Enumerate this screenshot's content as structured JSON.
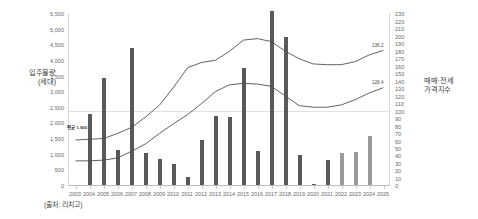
{
  "caption": "(출처: 리치고)",
  "axes": {
    "left_title": "입주물량\n(세대)",
    "right_title": "매매·전세\n가격지수",
    "left_ticks": [
      "5,500",
      "5,000",
      "4,500",
      "4,000",
      "3,500",
      "3,000",
      "2,500",
      "2,000",
      "1,500",
      "1,000",
      "500",
      "0"
    ],
    "right_ticks": [
      "230",
      "220",
      "210",
      "200",
      "190",
      "180",
      "170",
      "160",
      "150",
      "140",
      "130",
      "120",
      "110",
      "100",
      "90",
      "80",
      "70",
      "60",
      "50",
      "40",
      "30",
      "20",
      "10",
      "0"
    ],
    "x_ticks": [
      "2003",
      "2004",
      "2005",
      "2006",
      "2007",
      "2008",
      "2009",
      "2010",
      "2011",
      "2012",
      "2013",
      "2014",
      "2015",
      "2016",
      "2017",
      "2018",
      "2019",
      "2020",
      "2021",
      "2022",
      "2023",
      "2024",
      "2025"
    ]
  },
  "annotations": {
    "left_marker": "평균 1,900",
    "sale_line_label": "136.2",
    "jeonse_line_label": "128.4"
  },
  "colors": {
    "bar_actual": "#595959",
    "bar_forecast": "#9a9a9a",
    "line_sale": "#4f4f4f",
    "line_jeonse": "#4f4f4f",
    "gridline": "#e2e2e2",
    "axis": "#d6d6d6",
    "text": "#6b6b6b"
  },
  "chart_data": {
    "type": "bar",
    "title": "",
    "subtitle": "",
    "xlabel": "",
    "ylabel": "입주물량(세대)",
    "y2label": "매매·전세 가격지수",
    "grid": true,
    "legend": "none",
    "categories": [
      "2003",
      "2004",
      "2005",
      "2006",
      "2007",
      "2008",
      "2009",
      "2010",
      "2011",
      "2012",
      "2013",
      "2014",
      "2015",
      "2016",
      "2017",
      "2018",
      "2019",
      "2020",
      "2021",
      "2022",
      "2023",
      "2024",
      "2025"
    ],
    "ylim": [
      0,
      5500
    ],
    "y2lim": [
      0,
      230
    ],
    "series": [
      {
        "name": "입주물량",
        "type": "bar",
        "axis": "left",
        "values": [
          0,
          2300,
          3450,
          1150,
          4400,
          1050,
          870,
          700,
          300,
          1470,
          2230,
          2220,
          3760,
          1130,
          5600,
          4750,
          980,
          60,
          820,
          1050,
          1100,
          1600,
          0
        ],
        "forecast_from": "2022"
      },
      {
        "name": "매매가격지수",
        "type": "line",
        "axis": "right",
        "values": [
          61,
          62,
          63,
          70,
          78,
          92,
          108,
          132,
          158,
          165,
          168,
          180,
          195,
          197,
          193,
          180,
          170,
          163,
          162,
          162,
          166,
          175,
          181
        ],
        "end_label": "136.2"
      },
      {
        "name": "전세가격지수",
        "type": "line",
        "axis": "right",
        "values": [
          33,
          33,
          34,
          37,
          46,
          56,
          70,
          83,
          95,
          110,
          126,
          135,
          137,
          136,
          133,
          120,
          107,
          105,
          105,
          108,
          115,
          124,
          131
        ],
        "end_label": "128.4"
      }
    ]
  }
}
